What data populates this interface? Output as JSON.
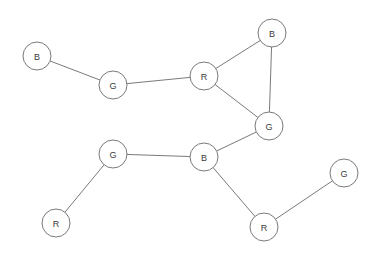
{
  "diagram": {
    "type": "node-link-graph",
    "width": 375,
    "height": 263,
    "background_color": "#ffffff",
    "stroke_color": "#7a7a7a",
    "node_fill_color": "#ffffff",
    "label_color": "#3a3a3a",
    "node_radius": 14
  },
  "nodes": [
    {
      "id": "n0",
      "label": "B",
      "x": 37,
      "y": 56,
      "name": "node-b-top-left"
    },
    {
      "id": "n1",
      "label": "G",
      "x": 113,
      "y": 85,
      "name": "node-g-upper-left"
    },
    {
      "id": "n2",
      "label": "R",
      "x": 204,
      "y": 76,
      "name": "node-r-upper-center"
    },
    {
      "id": "n3",
      "label": "B",
      "x": 272,
      "y": 33,
      "name": "node-b-top-right"
    },
    {
      "id": "n4",
      "label": "G",
      "x": 269,
      "y": 126,
      "name": "node-g-center-right"
    },
    {
      "id": "n5",
      "label": "G",
      "x": 113,
      "y": 154,
      "name": "node-g-middle-left"
    },
    {
      "id": "n6",
      "label": "B",
      "x": 204,
      "y": 157,
      "name": "node-b-middle-center"
    },
    {
      "id": "n7",
      "label": "R",
      "x": 56,
      "y": 223,
      "name": "node-r-bottom-left"
    },
    {
      "id": "n8",
      "label": "R",
      "x": 264,
      "y": 227,
      "name": "node-r-bottom-right"
    },
    {
      "id": "n9",
      "label": "G",
      "x": 344,
      "y": 173,
      "name": "node-g-far-right"
    }
  ],
  "edges": [
    {
      "from": "n0",
      "to": "n1",
      "name": "edge-b-top-left-to-g-upper-left"
    },
    {
      "from": "n1",
      "to": "n2",
      "name": "edge-g-upper-left-to-r-upper-center"
    },
    {
      "from": "n2",
      "to": "n3",
      "name": "edge-r-upper-center-to-b-top-right"
    },
    {
      "from": "n2",
      "to": "n4",
      "name": "edge-r-upper-center-to-g-center-right"
    },
    {
      "from": "n3",
      "to": "n4",
      "name": "edge-b-top-right-to-g-center-right"
    },
    {
      "from": "n4",
      "to": "n6",
      "name": "edge-g-center-right-to-b-middle-center"
    },
    {
      "from": "n5",
      "to": "n6",
      "name": "edge-g-middle-left-to-b-middle-center"
    },
    {
      "from": "n5",
      "to": "n7",
      "name": "edge-g-middle-left-to-r-bottom-left"
    },
    {
      "from": "n6",
      "to": "n8",
      "name": "edge-b-middle-center-to-r-bottom-right"
    },
    {
      "from": "n8",
      "to": "n9",
      "name": "edge-r-bottom-right-to-g-far-right"
    }
  ]
}
